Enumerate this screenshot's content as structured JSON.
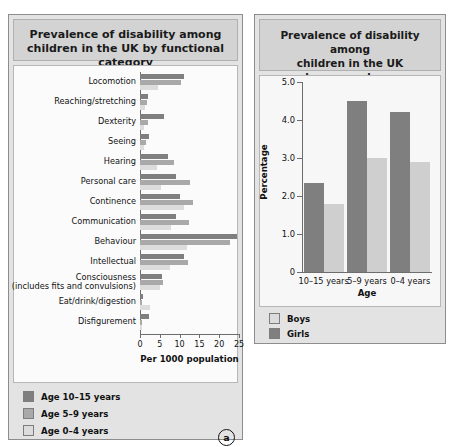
{
  "figure": {
    "panel_a_tag": "a",
    "panel_b_tag": "b"
  },
  "panel_a": {
    "title_line1": "Prevalence of disability among",
    "title_line2": "children in the UK by functional category",
    "legend": [
      {
        "label": "Age 10–15 years",
        "color": "#7f7f7f"
      },
      {
        "label": "Age 5–9 years",
        "color": "#a9a9a9"
      },
      {
        "label": "Age 0–4 years",
        "color": "#dcdcdc"
      }
    ]
  },
  "panel_b": {
    "title_line1": "Prevalence of disability among",
    "title_line2": "children in the UK",
    "title_line3": "by age and sex",
    "legend": [
      {
        "label": "Boys",
        "color": "#dcdcdc"
      },
      {
        "label": "Girls",
        "color": "#7f7f7f"
      }
    ]
  },
  "chart_data": [
    {
      "type": "bar",
      "orientation": "horizontal",
      "title": "Prevalence of disability among children in the UK by functional category",
      "xlabel": "Per 1000 population",
      "ylabel": "",
      "xlim": [
        0,
        25
      ],
      "xticks": [
        0,
        5,
        10,
        15,
        20,
        25
      ],
      "grid": false,
      "legend_position": "below-plot",
      "categories": [
        "Locomotion",
        "Reaching/stretching",
        "Dexterity",
        "Seeing",
        "Hearing",
        "Personal care",
        "Continence",
        "Communication",
        "Behaviour",
        "Intellectual",
        "Consciousness\n(includes fits and convulsions)",
        "Eat/drink/digestion",
        "Disfigurement"
      ],
      "series": [
        {
          "name": "Age 10–15 years",
          "color": "#7f7f7f",
          "values": [
            11.0,
            2.0,
            6.0,
            2.2,
            7.0,
            9.0,
            10.0,
            9.0,
            24.5,
            11.0,
            5.5,
            0.8,
            2.2
          ]
        },
        {
          "name": "Age 5–9 years",
          "color": "#a9a9a9",
          "values": [
            10.3,
            1.8,
            2.0,
            1.6,
            8.5,
            12.5,
            13.5,
            12.3,
            22.8,
            12.0,
            5.8,
            0.6,
            0.5
          ]
        },
        {
          "name": "Age 0–4 years",
          "color": "#dcdcdc",
          "values": [
            4.6,
            1.2,
            1.0,
            0.9,
            4.4,
            5.2,
            11.0,
            7.8,
            11.8,
            7.5,
            5.0,
            2.6,
            0.4
          ]
        }
      ]
    },
    {
      "type": "bar",
      "orientation": "vertical",
      "title": "Prevalence of disability among children in the UK by age and sex",
      "xlabel": "Age",
      "ylabel": "Percentage",
      "ylim": [
        0,
        5.0
      ],
      "yticks": [
        0,
        1.0,
        2.0,
        3.0,
        4.0,
        5.0
      ],
      "ytick_labels": [
        "0",
        "1.0",
        "2.0",
        "3.0",
        "4.0",
        "5.0"
      ],
      "grid": false,
      "legend_position": "below-plot",
      "categories": [
        "10–15 years",
        "5–9 years",
        "0–4 years"
      ],
      "series": [
        {
          "name": "Girls",
          "color": "#7f7f7f",
          "values": [
            2.35,
            4.5,
            4.2
          ]
        },
        {
          "name": "Boys",
          "color": "#cfcfcf",
          "values": [
            1.8,
            3.0,
            2.9
          ]
        }
      ]
    }
  ]
}
